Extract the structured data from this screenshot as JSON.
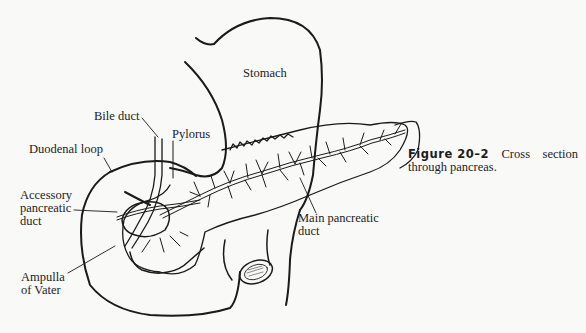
{
  "figure": {
    "number": "Figure 20–2",
    "caption_word1": "Cross",
    "caption_word2": "section",
    "caption_line2": "through pancreas."
  },
  "labels": {
    "stomach": "Stomach",
    "bile_duct": "Bile duct",
    "pylorus": "Pylorus",
    "duodenal_loop": "Duodenal loop",
    "accessory_duct_line1": "Accessory",
    "accessory_duct_line2": "pancreatic",
    "accessory_duct_line3": "duct",
    "main_duct_line1": "Main pancreatic",
    "main_duct_line2": "duct",
    "ampulla_line1": "Ampulla",
    "ampulla_line2": "of Vater"
  },
  "colors": {
    "background": "#f9f9f8",
    "ink": "#1a1a1a"
  }
}
